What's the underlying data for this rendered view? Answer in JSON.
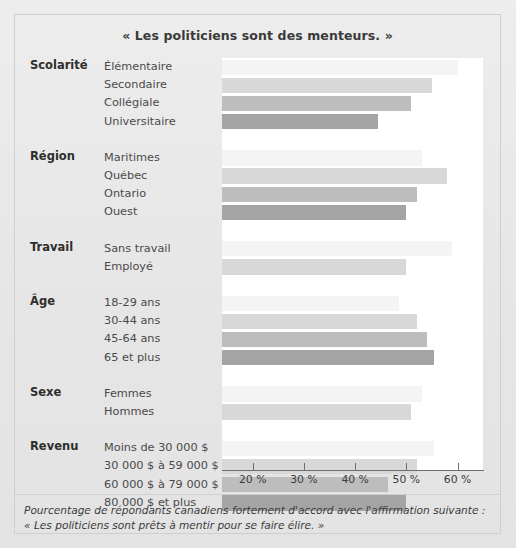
{
  "figure": {
    "title": "« Les politiciens sont des menteurs. »",
    "caption_line1": "Pourcentage de répondants canadiens fortement d'accord avec l'affirmation suivante :",
    "caption_line2": "« Les politiciens sont prêts à mentir pour se faire élire. »"
  },
  "axis": {
    "ticks": [
      {
        "label": "20 %",
        "value": 20
      },
      {
        "label": "30 %",
        "value": 30
      },
      {
        "label": "40 %",
        "value": 40
      },
      {
        "label": "50 %",
        "value": 50
      },
      {
        "label": "60 %",
        "value": 60
      }
    ]
  },
  "groups": [
    {
      "name": "Scolarité",
      "categories": [
        "Élémentaire",
        "Secondaire",
        "Collégiale",
        "Universitaire"
      ],
      "values": [
        60,
        55,
        51,
        44.5
      ]
    },
    {
      "name": "Région",
      "categories": [
        "Maritimes",
        "Québec",
        "Ontario",
        "Ouest"
      ],
      "values": [
        53,
        58,
        52,
        50
      ]
    },
    {
      "name": "Travail",
      "categories": [
        "Sans travail",
        "Employé"
      ],
      "values": [
        59,
        50
      ]
    },
    {
      "name": "Âge",
      "categories": [
        "18-29 ans",
        "30-44 ans",
        "45-64 ans",
        "65 et plus"
      ],
      "values": [
        48.5,
        52,
        54,
        55.5
      ]
    },
    {
      "name": "Sexe",
      "categories": [
        "Femmes",
        "Hommes"
      ],
      "values": [
        53,
        51
      ]
    },
    {
      "name": "Revenu",
      "categories": [
        "Moins de 30 000 $",
        "30 000 $ à 59 000 $",
        "60 000 $ à 79 000 $",
        "80 000 $ et plus"
      ],
      "values": [
        55.5,
        52,
        46.5,
        50
      ]
    }
  ],
  "colors": {
    "shade0": "#f4f4f4",
    "shade1": "#d8d8d8",
    "shade2": "#bdbdbd",
    "shade3": "#a4a4a4",
    "background": "#e9e9e9",
    "panel": "#ffffff",
    "axis": "#6f6f6f"
  },
  "chart_data": {
    "type": "bar",
    "orientation": "horizontal",
    "title": "« Les politiciens sont des menteurs. »",
    "xlabel": "",
    "ylabel": "",
    "xlim": [
      14,
      65
    ],
    "grid": false,
    "legend": "none",
    "xtick_labels": [
      "20 %",
      "30 %",
      "40 %",
      "50 %",
      "60 %"
    ],
    "xticks": [
      20,
      30,
      40,
      50,
      60
    ],
    "note": "Bars are clipped at the left edge of the plot area (~14 %); values are percentages of respondents strongly agreeing.",
    "groups": [
      {
        "name": "Scolarité",
        "categories": [
          "Élémentaire",
          "Secondaire",
          "Collégiale",
          "Universitaire"
        ],
        "values": [
          60,
          55,
          51,
          44.5
        ]
      },
      {
        "name": "Région",
        "categories": [
          "Maritimes",
          "Québec",
          "Ontario",
          "Ouest"
        ],
        "values": [
          53,
          58,
          52,
          50
        ]
      },
      {
        "name": "Travail",
        "categories": [
          "Sans travail",
          "Employé"
        ],
        "values": [
          59,
          50
        ]
      },
      {
        "name": "Âge",
        "categories": [
          "18-29 ans",
          "30-44 ans",
          "45-64 ans",
          "65 et plus"
        ],
        "values": [
          48.5,
          52,
          54,
          55.5
        ]
      },
      {
        "name": "Sexe",
        "categories": [
          "Femmes",
          "Hommes"
        ],
        "values": [
          53,
          51
        ]
      },
      {
        "name": "Revenu",
        "categories": [
          "Moins de 30 000 $",
          "30 000 $ à 59 000 $",
          "60 000 $ à 79 000 $",
          "80 000 $ et plus"
        ],
        "values": [
          55.5,
          52,
          46.5,
          50
        ]
      }
    ],
    "categories": [
      "Élémentaire",
      "Secondaire",
      "Collégiale",
      "Universitaire",
      "Maritimes",
      "Québec",
      "Ontario",
      "Ouest",
      "Sans travail",
      "Employé",
      "18-29 ans",
      "30-44 ans",
      "45-64 ans",
      "65 et plus",
      "Femmes",
      "Hommes",
      "Moins de 30 000 $",
      "30 000 $ à 59 000 $",
      "60 000 $ à 79 000 $",
      "80 000 $ et plus"
    ],
    "values": [
      60,
      55,
      51,
      44.5,
      53,
      58,
      52,
      50,
      59,
      50,
      48.5,
      52,
      54,
      55.5,
      53,
      51,
      55.5,
      52,
      46.5,
      50
    ],
    "caption": "Pourcentage de répondants canadiens fortement d'accord avec l'affirmation suivante : « Les politiciens sont prêts à mentir pour se faire élire. »"
  }
}
